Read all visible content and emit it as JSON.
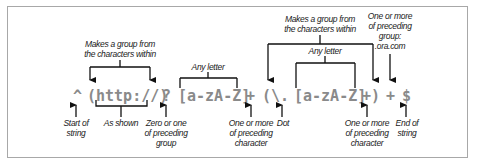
{
  "diagram": {
    "regex_tokens": [
      {
        "id": "caret",
        "text": "^",
        "x": 75
      },
      {
        "id": "group-http",
        "text": "(http://)",
        "x": 88
      },
      {
        "id": "question",
        "text": "?",
        "x": 163
      },
      {
        "id": "class1",
        "text": "[a-zA-Z]",
        "x": 179
      },
      {
        "id": "plus1",
        "text": "+",
        "x": 247
      },
      {
        "id": "group2-open",
        "text": "(\\.",
        "x": 263
      },
      {
        "id": "class2",
        "text": "[a-zA-Z]",
        "x": 294
      },
      {
        "id": "plus2-close",
        "text": "+)",
        "x": 362
      },
      {
        "id": "plus3",
        "text": "+",
        "x": 387
      },
      {
        "id": "dollar",
        "text": "$",
        "x": 403
      }
    ],
    "top_annotations": {
      "group1": {
        "line1": "Makes a group from",
        "line2": "the characters within"
      },
      "any_letter_1": "Any letter",
      "group2": {
        "line1": "Makes a group from",
        "line2": "the characters within"
      },
      "any_letter_2": "Any letter",
      "one_or_more_group": {
        "line1": "One or more",
        "line2": "of preceding",
        "line3": "group:",
        "line4": ".ora.com"
      }
    },
    "bottom_annotations": {
      "start": {
        "line1": "Start of",
        "line2": "string"
      },
      "as_shown": "As shown",
      "zero_or_one": {
        "line1": "Zero or one",
        "line2": "of preceding",
        "line3": "group"
      },
      "one_or_more_char_1": {
        "line1": "One or more",
        "line2": "of preceding",
        "line3": "character"
      },
      "dot": "Dot",
      "one_or_more_char_2": {
        "line1": "One or more",
        "line2": "of preceding",
        "line3": "character"
      },
      "end": {
        "line1": "End of",
        "line2": "string"
      }
    }
  }
}
